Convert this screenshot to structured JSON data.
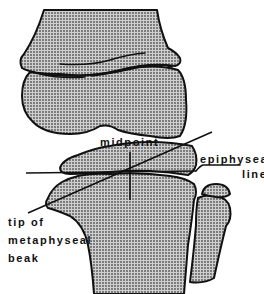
{
  "figure": {
    "type": "anatomical line drawing",
    "colors": {
      "ink": "#111111",
      "stipple": "#8a8a8a",
      "background": "#ffffff"
    }
  },
  "labels": {
    "midpoint": "midpoint",
    "epiphyseal_line_1": "epiphyseal",
    "epiphyseal_line_2": "line",
    "tip_1": "tip of",
    "tip_2": "metaphyseal",
    "tip_3": "beak"
  },
  "structures": [
    "femoral metaphysis",
    "femoral epiphysis",
    "tibial epiphysis",
    "tibial metaphysis",
    "fibula"
  ],
  "lines": [
    {
      "name": "epiphyseal line",
      "from": [
        26,
        173
      ],
      "to": [
        196,
        171
      ]
    },
    {
      "name": "metaphyseal-diaphyseal angle line",
      "from": [
        28,
        213
      ],
      "to": [
        212,
        132
      ]
    },
    {
      "name": "midpoint perpendicular",
      "from": [
        130,
        152
      ],
      "to": [
        130,
        200
      ]
    }
  ]
}
